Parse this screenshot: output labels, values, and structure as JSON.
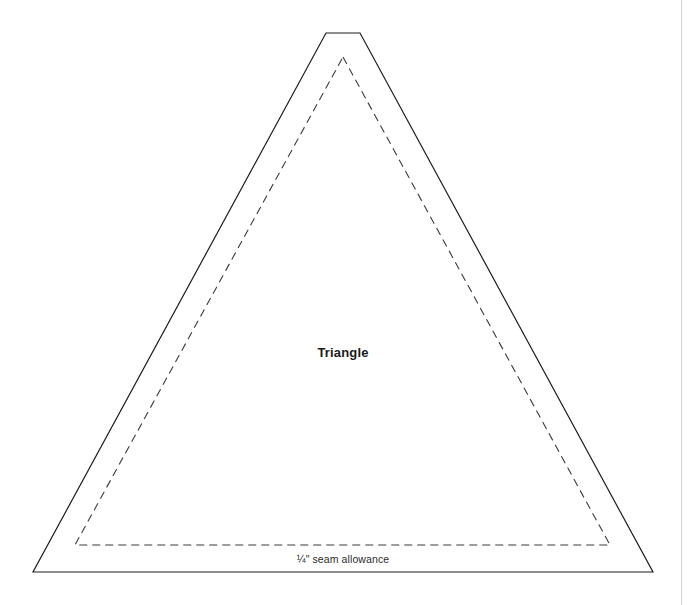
{
  "document": {
    "type": "sewing-pattern-template",
    "background_color": "#ffffff"
  },
  "page_edge": {
    "name": "right-page-edge",
    "x": 681,
    "color": "#d2d2d2"
  },
  "labels": {
    "piece_name": "Triangle",
    "piece_name_x": 343,
    "piece_name_y": 352,
    "seam_allowance": "¼\" seam allowance",
    "seam_allowance_x": 343,
    "seam_allowance_y": 559
  },
  "shapes": {
    "cut_line": {
      "name": "outer-cut-line",
      "style": "solid",
      "stroke": "#1c1c1c",
      "stroke_width": 1.2,
      "points": "326,33 360,33 653,572 33,572"
    },
    "stitch_line": {
      "name": "inner-stitch-line",
      "style": "dashed",
      "stroke": "#3a3a3a",
      "stroke_width": 1.1,
      "dash_pattern": "8 5",
      "points": "343,57 610,545 75,545"
    }
  }
}
